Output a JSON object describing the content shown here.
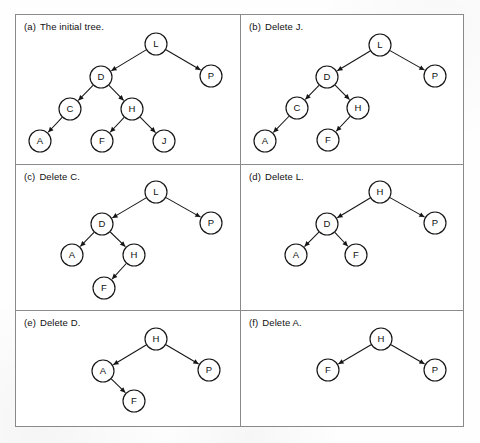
{
  "figure": {
    "panels": [
      {
        "id": "panel-a",
        "label": "(a)",
        "caption": "The initial tree.",
        "nodes": [
          {
            "id": "L",
            "label": "L",
            "x": 156,
            "y": 44
          },
          {
            "id": "D",
            "label": "D",
            "x": 101,
            "y": 77
          },
          {
            "id": "P",
            "label": "P",
            "x": 211,
            "y": 76
          },
          {
            "id": "C",
            "label": "C",
            "x": 70,
            "y": 109
          },
          {
            "id": "H",
            "label": "H",
            "x": 132,
            "y": 109
          },
          {
            "id": "A",
            "label": "A",
            "x": 40,
            "y": 141
          },
          {
            "id": "F",
            "label": "F",
            "x": 102,
            "y": 141
          },
          {
            "id": "J",
            "label": "J",
            "x": 164,
            "y": 141
          }
        ],
        "edges": [
          {
            "from": "L",
            "to": "D"
          },
          {
            "from": "L",
            "to": "P"
          },
          {
            "from": "D",
            "to": "C"
          },
          {
            "from": "D",
            "to": "H"
          },
          {
            "from": "C",
            "to": "A"
          },
          {
            "from": "H",
            "to": "F"
          },
          {
            "from": "H",
            "to": "J"
          }
        ]
      },
      {
        "id": "panel-b",
        "label": "(b)",
        "caption": "Delete J.",
        "nodes": [
          {
            "id": "L",
            "label": "L",
            "x": 380,
            "y": 45
          },
          {
            "id": "D",
            "label": "D",
            "x": 327,
            "y": 77
          },
          {
            "id": "P",
            "label": "P",
            "x": 435,
            "y": 76
          },
          {
            "id": "C",
            "label": "C",
            "x": 297,
            "y": 108
          },
          {
            "id": "H",
            "label": "H",
            "x": 358,
            "y": 108
          },
          {
            "id": "A",
            "label": "A",
            "x": 265,
            "y": 141
          },
          {
            "id": "F",
            "label": "F",
            "x": 328,
            "y": 140
          }
        ],
        "edges": [
          {
            "from": "L",
            "to": "D"
          },
          {
            "from": "L",
            "to": "P"
          },
          {
            "from": "D",
            "to": "C"
          },
          {
            "from": "D",
            "to": "H"
          },
          {
            "from": "C",
            "to": "A"
          },
          {
            "from": "H",
            "to": "F"
          }
        ]
      },
      {
        "id": "panel-c",
        "label": "(c)",
        "caption": "Delete C.",
        "nodes": [
          {
            "id": "L",
            "label": "L",
            "x": 156,
            "y": 192
          },
          {
            "id": "D",
            "label": "D",
            "x": 102,
            "y": 224
          },
          {
            "id": "P",
            "label": "P",
            "x": 211,
            "y": 223
          },
          {
            "id": "A",
            "label": "A",
            "x": 72,
            "y": 255
          },
          {
            "id": "H",
            "label": "H",
            "x": 134,
            "y": 255
          },
          {
            "id": "F",
            "label": "F",
            "x": 104,
            "y": 288
          }
        ],
        "edges": [
          {
            "from": "L",
            "to": "D"
          },
          {
            "from": "L",
            "to": "P"
          },
          {
            "from": "D",
            "to": "A"
          },
          {
            "from": "D",
            "to": "H"
          },
          {
            "from": "H",
            "to": "F"
          }
        ]
      },
      {
        "id": "panel-d",
        "label": "(d)",
        "caption": "Delete L.",
        "nodes": [
          {
            "id": "H",
            "label": "H",
            "x": 380,
            "y": 192
          },
          {
            "id": "D",
            "label": "D",
            "x": 327,
            "y": 224
          },
          {
            "id": "P",
            "label": "P",
            "x": 435,
            "y": 223
          },
          {
            "id": "A",
            "label": "A",
            "x": 296,
            "y": 255
          },
          {
            "id": "F",
            "label": "F",
            "x": 356,
            "y": 255
          }
        ],
        "edges": [
          {
            "from": "H",
            "to": "D"
          },
          {
            "from": "H",
            "to": "P"
          },
          {
            "from": "D",
            "to": "A"
          },
          {
            "from": "D",
            "to": "F"
          }
        ]
      },
      {
        "id": "panel-e",
        "label": "(e)",
        "caption": "Delete D.",
        "nodes": [
          {
            "id": "H",
            "label": "H",
            "x": 156,
            "y": 339
          },
          {
            "id": "A",
            "label": "A",
            "x": 103,
            "y": 371
          },
          {
            "id": "P",
            "label": "P",
            "x": 209,
            "y": 370
          },
          {
            "id": "F",
            "label": "F",
            "x": 134,
            "y": 401
          }
        ],
        "edges": [
          {
            "from": "H",
            "to": "A"
          },
          {
            "from": "H",
            "to": "P"
          },
          {
            "from": "A",
            "to": "F"
          }
        ]
      },
      {
        "id": "panel-f",
        "label": "(f)",
        "caption": "Delete A.",
        "nodes": [
          {
            "id": "H",
            "label": "H",
            "x": 381,
            "y": 339
          },
          {
            "id": "F",
            "label": "F",
            "x": 328,
            "y": 370
          },
          {
            "id": "P",
            "label": "P",
            "x": 435,
            "y": 370
          }
        ],
        "edges": [
          {
            "from": "H",
            "to": "F"
          },
          {
            "from": "H",
            "to": "P"
          }
        ]
      }
    ],
    "geometry": {
      "node_radius": 11,
      "frame": {
        "x": 15,
        "y": 14,
        "w": 449,
        "h": 413
      },
      "vdivider_x": 240,
      "hdivider_y": [
        164,
        310
      ]
    },
    "colors": {
      "stroke": "#151515",
      "frame": "#8a8a8a",
      "node_fill": "#ffffff",
      "text": "#111111",
      "background": "#ffffff"
    }
  }
}
